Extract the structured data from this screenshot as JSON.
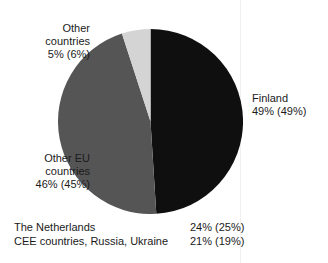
{
  "page": {
    "clipped_header_fragment": "",
    "background_color": "#ffffff"
  },
  "chart_data": {
    "type": "pie",
    "title": "",
    "subtitle": "",
    "xlabel": "",
    "ylabel": "",
    "legend_position": "callout-labels",
    "grid": false,
    "value_note": "Values shown as current% (previous%) in parentheses",
    "categories": [
      "Finland",
      "Other EU countries",
      "Other countries"
    ],
    "values": [
      49,
      46,
      5
    ],
    "previous_values": [
      49,
      45,
      6
    ],
    "colors": [
      "#100f0f",
      "#555555",
      "#d4d4d4"
    ],
    "slices": [
      {
        "name": "Finland",
        "label": "Finland",
        "value": 49,
        "previous_value": 6,
        "value_text": "49% (49%)",
        "color": "#100f0f",
        "start_angle_deg": 0,
        "sweep_deg": 176.4
      },
      {
        "name": "Other EU countries",
        "label_line1": "Other EU",
        "label_line2": "countries",
        "value": 46,
        "previous_value": 45,
        "value_text": "46% (45%)",
        "color": "#555555",
        "start_angle_deg": 176.4,
        "sweep_deg": 165.6
      },
      {
        "name": "Other countries",
        "label_line1": "Other",
        "label_line2": "countries",
        "value": 5,
        "previous_value": 6,
        "value_text": "5% (6%)",
        "color": "#d4d4d4",
        "start_angle_deg": 342.0,
        "sweep_deg": 18.0
      }
    ],
    "sub_breakdown": {
      "rows": [
        {
          "name": "The Netherlands",
          "value_text": "24% (25%)",
          "value": 24,
          "previous_value": 25
        },
        {
          "name": "CEE countries, Russia, Ukraine",
          "value_text": "21% (19%)",
          "value": 21,
          "previous_value": 19
        }
      ]
    }
  },
  "labels": {
    "other_countries": {
      "line1": "Other",
      "line2": "countries",
      "line3": "5% (6%)"
    },
    "other_eu": {
      "line1": "Other EU",
      "line2": "countries",
      "line3": "46% (45%)"
    },
    "finland": {
      "line1": "Finland",
      "line2": "49% (49%)"
    }
  },
  "bottom_rows": [
    {
      "name": "The Netherlands",
      "value": "24% (25%)"
    },
    {
      "name": "CEE countries, Russia, Ukraine",
      "value": "21% (19%)"
    }
  ]
}
